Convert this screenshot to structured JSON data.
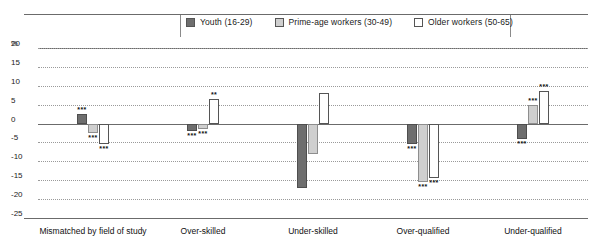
{
  "chart_data": {
    "type": "bar",
    "title": "",
    "xlabel": "",
    "ylabel": "%",
    "ylim": [
      -25,
      20
    ],
    "grid": true,
    "legend_position": "top",
    "yticks": [
      "20",
      "15",
      "10",
      "5",
      "0",
      "-5",
      "-10",
      "-15",
      "-20",
      "-25"
    ],
    "categories": [
      "Mismatched by field of study",
      "Over-skilled",
      "Under-skilled",
      "Over-qualified",
      "Under-qualified"
    ],
    "series": [
      {
        "name": "Youth (16-29)",
        "color": "#6e6e6e",
        "values": [
          2.5,
          -2.0,
          -17.0,
          -5.5,
          -4.0
        ],
        "significance": [
          "***",
          "***",
          "",
          "***",
          "***"
        ]
      },
      {
        "name": "Prime-age workers (30-49)",
        "color": "#cfcfcf",
        "values": [
          -2.5,
          -1.5,
          -8.0,
          -15.5,
          5.0
        ],
        "significance": [
          "***",
          "***",
          "",
          "***",
          "***"
        ]
      },
      {
        "name": "Older workers (50-65)",
        "color": "#ffffff",
        "values": [
          -5.5,
          6.5,
          8.0,
          -14.5,
          8.5
        ],
        "significance": [
          "***",
          "**",
          "",
          "***",
          "***"
        ]
      }
    ]
  },
  "legend": {
    "items": [
      {
        "label": "Youth (16-29)",
        "swatch": "#6e6e6e"
      },
      {
        "label": "Prime-age workers (30-49)",
        "swatch": "#cfcfcf"
      },
      {
        "label": "Older workers (50-65)",
        "swatch": "#ffffff"
      }
    ]
  },
  "axis": {
    "unit_label": "%"
  }
}
